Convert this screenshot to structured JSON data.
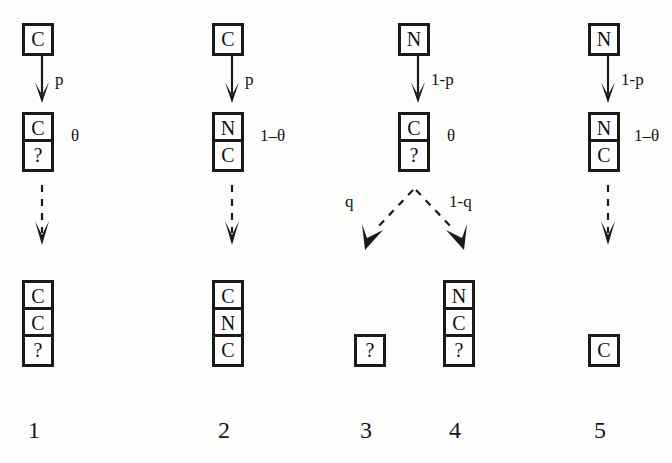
{
  "diagram": {
    "ink_color": "#1a1a1a",
    "paper_color": "#fdfdfc",
    "columns": [
      {
        "id": 1,
        "number_label": "1",
        "root": {
          "cells": [
            "C"
          ]
        },
        "first_arrow_label": "p",
        "middle": {
          "cells": [
            "C",
            "?"
          ]
        },
        "middle_label": "θ",
        "outcome": {
          "cells": [
            "C",
            "C",
            "?"
          ]
        }
      },
      {
        "id": 2,
        "number_label": "2",
        "root": {
          "cells": [
            "C"
          ]
        },
        "first_arrow_label": "p",
        "middle": {
          "cells": [
            "N",
            "C"
          ]
        },
        "middle_label": "1–θ",
        "outcome": {
          "cells": [
            "C",
            "N",
            "C"
          ]
        }
      },
      {
        "id": 3,
        "number_label": "3",
        "root": {
          "cells": [
            "N"
          ]
        },
        "first_arrow_label": "1-p",
        "middle": {
          "cells": [
            "C",
            "?"
          ]
        },
        "middle_label": "θ",
        "branch_left_label": "q",
        "branch_right_label": "1-q",
        "outcome": {
          "cells": [
            "?"
          ]
        }
      },
      {
        "id": 4,
        "number_label": "4",
        "outcome": {
          "cells": [
            "N",
            "C",
            "?"
          ]
        }
      },
      {
        "id": 5,
        "number_label": "5",
        "root": {
          "cells": [
            "N"
          ]
        },
        "first_arrow_label": "1-p",
        "middle": {
          "cells": [
            "N",
            "C"
          ]
        },
        "middle_label": "1–θ",
        "outcome": {
          "cells": [
            "C"
          ]
        }
      }
    ]
  }
}
